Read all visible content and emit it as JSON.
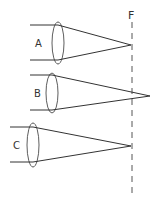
{
  "diagram": {
    "focal_label": "F",
    "lenses": [
      {
        "label": "A",
        "focus": "at F"
      },
      {
        "label": "B",
        "focus": "beyond F"
      },
      {
        "label": "C",
        "focus": "at F"
      }
    ],
    "colors": {
      "stroke": "#333333",
      "background": "#ffffff"
    }
  }
}
